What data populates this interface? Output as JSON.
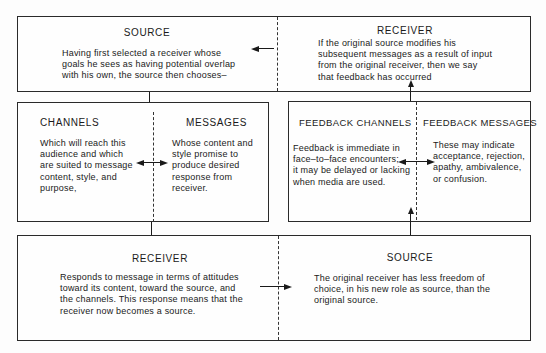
{
  "top": {
    "source": {
      "title": "SOURCE",
      "lines": [
        "Having first selected a receiver whose",
        "goals he sees as having potential overlap",
        "with his own, the source then chooses–"
      ]
    },
    "receiver": {
      "title": "RECEIVER",
      "lines": [
        "If the original source modifies his",
        "subsequent messages as a result of input",
        "from the original receiver, then we say",
        "that feedback has occurred"
      ]
    }
  },
  "middle": {
    "channels": {
      "title": "CHANNELS",
      "lines": [
        "Which will reach this",
        "audience and which",
        "are suited to message",
        "content, style, and",
        "purpose,"
      ]
    },
    "messages": {
      "title": "MESSAGES",
      "lines": [
        "Whose content and",
        "style promise to",
        "produce desired",
        "response from",
        "receiver."
      ]
    },
    "feedback_channels": {
      "title": "FEEDBACK CHANNELS",
      "lines": [
        "Feedback is immediate in",
        "face–to–face encounters;",
        "it may be delayed or lacking",
        "when media are used."
      ]
    },
    "feedback_messages": {
      "title": "FEEDBACK MESSAGES",
      "lines": [
        "These may indicate",
        "acceptance, rejection,",
        "apathy, ambivalence,",
        "or confusion."
      ]
    }
  },
  "bottom": {
    "receiver": {
      "title": "RECEIVER",
      "lines": [
        "Responds to message in terms of attitudes",
        "toward its content, toward the source, and",
        "the channels. This response means that the",
        "receiver now becomes a source."
      ]
    },
    "source": {
      "title": "SOURCE",
      "lines": [
        "The original receiver has less freedom of",
        "choice, in his new role as source, than the",
        "original source."
      ]
    }
  }
}
